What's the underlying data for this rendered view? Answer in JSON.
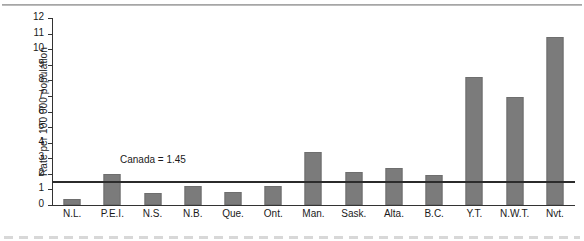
{
  "chart_data": {
    "type": "bar",
    "title": "",
    "xlabel": "",
    "ylabel": "Rate per 100 000 population",
    "ylim": [
      0,
      12
    ],
    "yticks": [
      0,
      1,
      2,
      3,
      4,
      5,
      6,
      7,
      8,
      9,
      10,
      11,
      12
    ],
    "ytick_labels": [
      "0",
      "1",
      "2",
      "3",
      "4",
      "5",
      "6",
      "7",
      "8",
      "9",
      "10",
      "11",
      "12"
    ],
    "grid": false,
    "legend": "none",
    "categories": [
      "N.L.",
      "P.E.I.",
      "N.S.",
      "N.B.",
      "Que.",
      "Ont.",
      "Man.",
      "Sask.",
      "Alta.",
      "B.C.",
      "Y.T.",
      "N.W.T.",
      "Nvt."
    ],
    "values": [
      0.4,
      2.0,
      0.75,
      1.2,
      0.85,
      1.25,
      3.4,
      2.15,
      2.4,
      1.9,
      8.2,
      6.9,
      10.8
    ],
    "bar_color": "#7b7b7b",
    "annotations": [
      {
        "name": "canada-average-line",
        "label": "Canada = 1.45",
        "value": 1.45,
        "line_color": "#2b2b2b"
      }
    ]
  }
}
